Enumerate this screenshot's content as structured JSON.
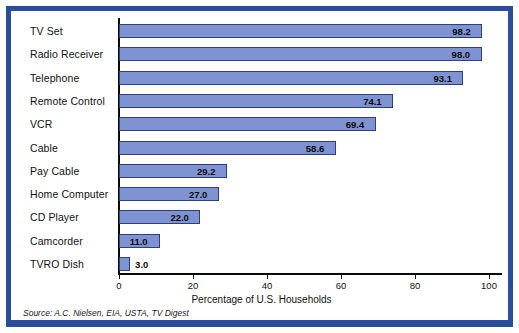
{
  "chart_data": {
    "type": "bar",
    "orientation": "horizontal",
    "title": "",
    "xlabel": "Percentage of U.S. Households",
    "ylabel": "",
    "xlim": [
      0,
      100
    ],
    "xticks": [
      0,
      20,
      40,
      60,
      80,
      100
    ],
    "grid": false,
    "legend": null,
    "categories": [
      "TV Set",
      "Radio Receiver",
      "Telephone",
      "Remote Control",
      "VCR",
      "Cable",
      "Pay Cable",
      "Home Computer",
      "CD Player",
      "Camcorder",
      "TVRO Dish"
    ],
    "values": [
      98.2,
      98.0,
      93.1,
      74.1,
      69.4,
      58.6,
      29.2,
      27.0,
      22.0,
      11.0,
      3.0
    ],
    "value_labels": [
      "98.2",
      "98.0",
      "93.1",
      "74.1",
      "69.4",
      "58.6",
      "29.2",
      "27.0",
      "22.0",
      "11.0",
      "3.0"
    ],
    "bar_color": "#7f93d2",
    "bar_edge_color": "#2e3f7d",
    "frame_color": "#2b4fa0"
  },
  "source": {
    "prefix": "Source:",
    "text": "A.C. Nielsen, EIA, USTA,",
    "suffix": "TV Digest",
    "full": "Source: A.C. Nielsen, EIA, USTA, TV Digest"
  }
}
